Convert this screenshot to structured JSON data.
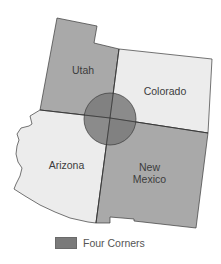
{
  "map": {
    "title": "",
    "states": [
      {
        "name": "Utah",
        "label": "Utah",
        "fill": "#a9a9a9"
      },
      {
        "name": "Colorado",
        "label": "Colorado",
        "fill": "#ececec"
      },
      {
        "name": "Arizona",
        "label": "Arizona",
        "fill": "#ececec"
      },
      {
        "name": "New Mexico",
        "label": "New\nMexico",
        "fill": "#a9a9a9"
      }
    ],
    "highlight": {
      "name": "Four Corners",
      "fill": "#7a7a7a"
    }
  },
  "legend": {
    "items": [
      {
        "label": "Four Corners",
        "color": "#7a7a7a"
      }
    ]
  }
}
